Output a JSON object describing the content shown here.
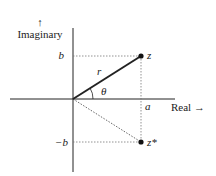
{
  "diagram": {
    "type": "complex-plane",
    "y_axis_arrow": "↑",
    "y_axis_label": "Imaginary",
    "x_axis_label": "Real →",
    "point_z_label": "z",
    "point_conj_label": "z*",
    "real_part_label": "a",
    "imag_part_label": "b",
    "neg_imag_part_label": "−b",
    "modulus_label": "r",
    "angle_label": "θ",
    "colors": {
      "line": "#222222",
      "dotted": "#666666"
    }
  }
}
